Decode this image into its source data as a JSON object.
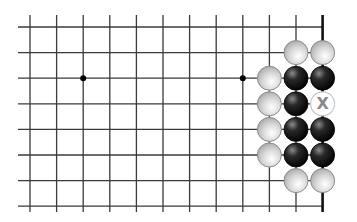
{
  "board": {
    "title": "Go board diagram",
    "columns": 12,
    "rows": 8,
    "right_edge": true,
    "hoshi": [
      {
        "col": 2,
        "row": 2
      },
      {
        "col": 8,
        "row": 2
      }
    ],
    "stones": [
      {
        "col": 10,
        "row": 1,
        "color": "white"
      },
      {
        "col": 11,
        "row": 1,
        "color": "white"
      },
      {
        "col": 9,
        "row": 2,
        "color": "white"
      },
      {
        "col": 10,
        "row": 2,
        "color": "black"
      },
      {
        "col": 11,
        "row": 2,
        "color": "black"
      },
      {
        "col": 9,
        "row": 3,
        "color": "white"
      },
      {
        "col": 10,
        "row": 3,
        "color": "black"
      },
      {
        "col": 11,
        "row": 3,
        "color": "marked",
        "label": "X"
      },
      {
        "col": 9,
        "row": 4,
        "color": "white"
      },
      {
        "col": 10,
        "row": 4,
        "color": "black"
      },
      {
        "col": 11,
        "row": 4,
        "color": "black"
      },
      {
        "col": 9,
        "row": 5,
        "color": "white"
      },
      {
        "col": 10,
        "row": 5,
        "color": "black"
      },
      {
        "col": 11,
        "row": 5,
        "color": "black"
      },
      {
        "col": 10,
        "row": 6,
        "color": "white"
      },
      {
        "col": 11,
        "row": 6,
        "color": "white"
      }
    ],
    "colors": {
      "line": "#3a3a3a",
      "black_stone": "#111111",
      "white_stone": "#b8b8b8",
      "mark": "#8a8a8a"
    }
  }
}
